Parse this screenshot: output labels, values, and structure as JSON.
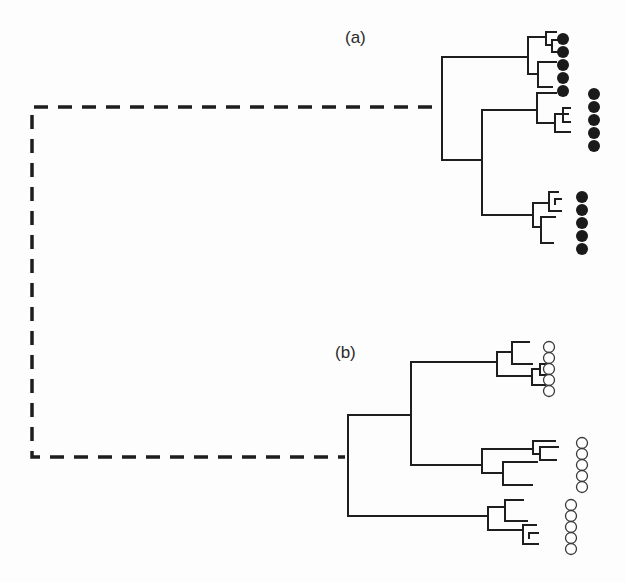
{
  "figure": {
    "type": "phylogenetic-tree",
    "colors": {
      "line": "#1e1e1e",
      "filled_marker": "#1a1a1a",
      "open_marker_stroke": "#3a3a3a",
      "background": "#fdfdfd"
    },
    "labels": [
      {
        "id": "a",
        "text": "(a)",
        "x": 345,
        "y": 28
      },
      {
        "id": "b",
        "text": "(b)",
        "x": 335,
        "y": 343
      }
    ],
    "dashed_connector": {
      "points": [
        [
          432,
          107
        ],
        [
          32,
          107
        ],
        [
          32,
          457
        ],
        [
          345,
          457
        ]
      ]
    },
    "clades": [
      {
        "id": "a",
        "marker": "filled",
        "segments": [
          [
            442,
            57,
            442,
            160
          ],
          [
            442,
            57,
            528,
            57
          ],
          [
            442,
            160,
            482,
            160
          ],
          [
            528,
            37,
            528,
            74
          ],
          [
            528,
            37,
            546,
            37
          ],
          [
            528,
            74,
            538,
            74
          ],
          [
            538,
            62,
            538,
            87
          ],
          [
            538,
            62,
            556,
            62
          ],
          [
            538,
            87,
            552,
            87
          ],
          [
            546,
            32,
            546,
            45
          ],
          [
            546,
            32,
            556,
            32
          ],
          [
            546,
            45,
            552,
            45
          ],
          [
            552,
            40,
            552,
            52
          ],
          [
            552,
            40,
            560,
            40
          ],
          [
            552,
            52,
            560,
            52
          ],
          [
            482,
            110,
            482,
            215
          ],
          [
            482,
            110,
            537,
            110
          ],
          [
            482,
            215,
            533,
            215
          ],
          [
            537,
            93,
            537,
            123
          ],
          [
            537,
            93,
            556,
            93
          ],
          [
            537,
            123,
            555,
            123
          ],
          [
            555,
            114,
            555,
            132
          ],
          [
            555,
            114,
            568,
            114
          ],
          [
            555,
            132,
            570,
            132
          ],
          [
            563,
            108,
            563,
            122
          ],
          [
            563,
            108,
            570,
            108
          ],
          [
            563,
            122,
            570,
            122
          ],
          [
            533,
            203,
            533,
            227
          ],
          [
            533,
            203,
            549,
            203
          ],
          [
            533,
            227,
            541,
            227
          ],
          [
            549,
            192,
            549,
            211
          ],
          [
            549,
            192,
            558,
            192
          ],
          [
            549,
            211,
            561,
            211
          ],
          [
            555,
            199,
            555,
            204
          ],
          [
            555,
            199,
            561,
            199
          ],
          [
            541,
            217,
            541,
            243
          ],
          [
            541,
            217,
            555,
            217
          ],
          [
            541,
            243,
            553,
            243
          ]
        ],
        "marker_groups": [
          {
            "x": 563,
            "ys": [
              39,
              52,
              65,
              78,
              91
            ],
            "r": 6
          },
          {
            "x": 594,
            "ys": [
              94,
              107,
              120,
              133,
              146
            ],
            "r": 6
          },
          {
            "x": 582,
            "ys": [
              197,
              210,
              223,
              236,
              249
            ],
            "r": 6
          }
        ]
      },
      {
        "id": "b",
        "marker": "open",
        "segments": [
          [
            348,
            415,
            348,
            516
          ],
          [
            348,
            415,
            411,
            415
          ],
          [
            348,
            516,
            488,
            516
          ],
          [
            411,
            362,
            411,
            465
          ],
          [
            411,
            362,
            497,
            362
          ],
          [
            411,
            465,
            482,
            465
          ],
          [
            497,
            352,
            497,
            376
          ],
          [
            497,
            352,
            512,
            352
          ],
          [
            497,
            376,
            532,
            376
          ],
          [
            512,
            342,
            512,
            364
          ],
          [
            512,
            342,
            529,
            342
          ],
          [
            512,
            364,
            532,
            364
          ],
          [
            532,
            369,
            532,
            385
          ],
          [
            532,
            369,
            540,
            369
          ],
          [
            532,
            385,
            545,
            385
          ],
          [
            540,
            364,
            540,
            375
          ],
          [
            540,
            364,
            547,
            364
          ],
          [
            540,
            375,
            547,
            375
          ],
          [
            482,
            449,
            482,
            473
          ],
          [
            482,
            449,
            533,
            449
          ],
          [
            482,
            473,
            503,
            473
          ],
          [
            533,
            441,
            533,
            454
          ],
          [
            533,
            441,
            555,
            441
          ],
          [
            533,
            454,
            540,
            454
          ],
          [
            540,
            447,
            540,
            460
          ],
          [
            540,
            447,
            558,
            447
          ],
          [
            540,
            460,
            556,
            460
          ],
          [
            503,
            462,
            503,
            485
          ],
          [
            503,
            462,
            537,
            462
          ],
          [
            503,
            485,
            532,
            485
          ],
          [
            488,
            507,
            488,
            530
          ],
          [
            488,
            507,
            505,
            507
          ],
          [
            488,
            530,
            523,
            530
          ],
          [
            505,
            500,
            505,
            521
          ],
          [
            505,
            500,
            523,
            500
          ],
          [
            505,
            521,
            527,
            521
          ],
          [
            523,
            525,
            523,
            544
          ],
          [
            523,
            525,
            536,
            525
          ],
          [
            523,
            544,
            538,
            544
          ],
          [
            529,
            533,
            529,
            538
          ],
          [
            529,
            533,
            538,
            533
          ]
        ],
        "marker_groups": [
          {
            "x": 549,
            "ys": [
              347,
              358,
              369,
              380,
              391
            ],
            "r": 5.5
          },
          {
            "x": 582,
            "ys": [
              443,
              454,
              465,
              476,
              487
            ],
            "r": 5.5
          },
          {
            "x": 571,
            "ys": [
              505,
              516,
              527,
              538,
              549
            ],
            "r": 5.5
          }
        ]
      }
    ]
  }
}
